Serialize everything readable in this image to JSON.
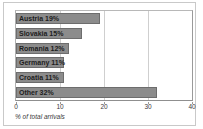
{
  "chart_data": {
    "type": "bar",
    "orientation": "horizontal",
    "title": "",
    "subtitle": "",
    "xlabel": "% of total arrivals",
    "ylabel": "",
    "categories": [
      "Austria",
      "Slovakia",
      "Romania",
      "Germany",
      "Croatia",
      "Other"
    ],
    "values": [
      19,
      15,
      12,
      11,
      11,
      32
    ],
    "bar_labels": [
      "Austria 19%",
      "Slovakia 15%",
      "Romania 12%",
      "Germany 11%",
      "Croatia 11%",
      "Other 32%"
    ],
    "xlim": [
      0,
      40
    ],
    "xticks": [
      0,
      10,
      20,
      30,
      40
    ],
    "xtick_labels": [
      "0",
      "10",
      "20",
      "30",
      "40"
    ],
    "grid": true,
    "grid_axis": "x",
    "legend": false,
    "colors": {
      "bar_fill": "#8c8c8c",
      "bar_stroke": "#6d6d6d",
      "gridline": "#cfcfcf",
      "plot_background": "#ffffff",
      "frame_border": "#c9c9c9",
      "axis_text": "#3a3a3a",
      "label_text": "#1d1d1d"
    }
  }
}
